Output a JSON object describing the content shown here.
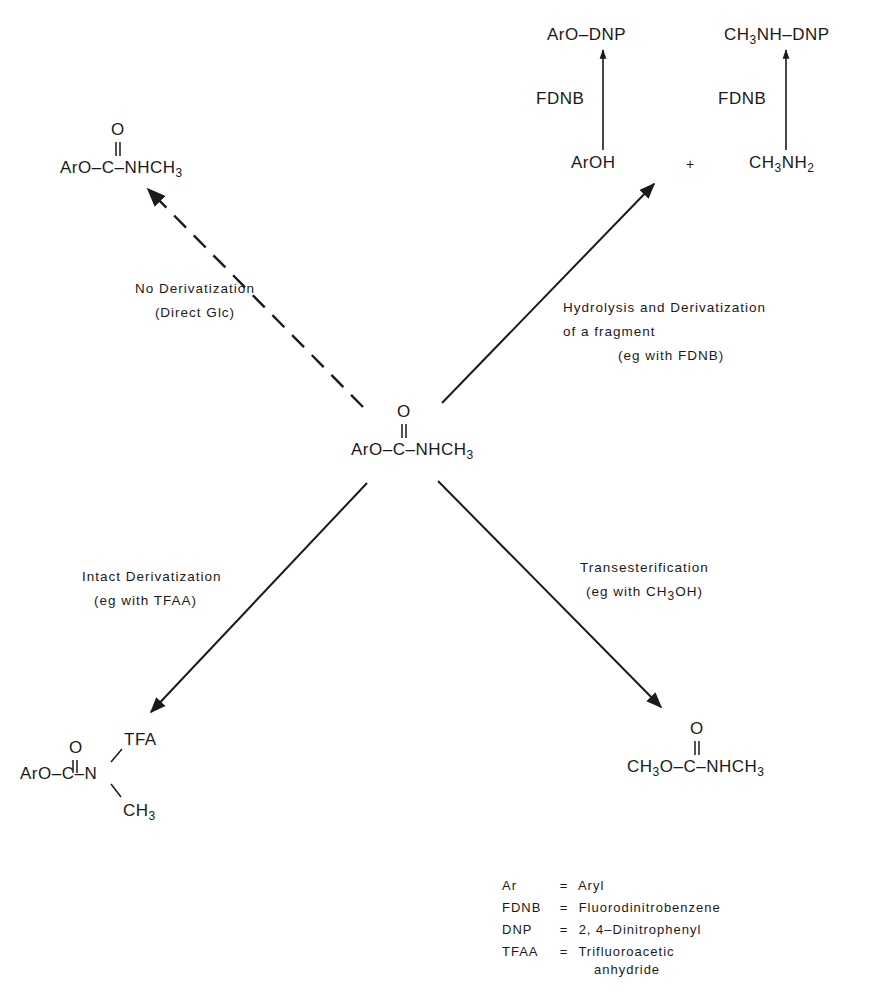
{
  "center": {
    "prefix": "ArO–C–NHCH",
    "sub": "3",
    "carbonyl": "O"
  },
  "products": {
    "no_derivatization": {
      "prefix": "ArO–C–NHCH",
      "sub": "3",
      "carbonyl": "O"
    },
    "hydrolysis": {
      "phenol": "ArOH",
      "plus": "+",
      "amine_pre": "CH",
      "amine_sub1": "3",
      "amine_mid": "NH",
      "amine_sub2": "2",
      "reagent_left": "FDNB",
      "reagent_right": "FDNB",
      "product_left": "ArO–DNP",
      "product_right_pre": "CH",
      "product_right_sub": "3",
      "product_right_post": "NH–DNP"
    },
    "intact": {
      "prefix": "ArO–C–N",
      "carbonyl": "O",
      "top_group": "TFA",
      "bottom_pre": "CH",
      "bottom_sub": "3"
    },
    "transesterification": {
      "pre": "CH",
      "sub1": "3",
      "mid": "O–C–NHCH",
      "sub2": "3",
      "carbonyl": "O"
    }
  },
  "labels": {
    "no_derivatization": {
      "line1": "No Derivatization",
      "line2": "(Direct Glc)"
    },
    "hydrolysis": {
      "line1": "Hydrolysis and Derivatization",
      "line2": "of a fragment",
      "line3": "(eg with FDNB)"
    },
    "intact": {
      "line1": "Intact Derivatization",
      "line2": "(eg with TFAA)"
    },
    "transesterification": {
      "line1": "Transesterification",
      "line2_pre": "(eg with CH",
      "line2_sub": "3",
      "line2_post": "OH)"
    }
  },
  "legend": [
    {
      "abbr": "Ar",
      "eq": "=",
      "meaning": "Aryl"
    },
    {
      "abbr": "FDNB",
      "eq": "=",
      "meaning": "Fluorodinitrobenzene"
    },
    {
      "abbr": "DNP",
      "eq": "=",
      "meaning": "2, 4–Dinitrophenyl"
    },
    {
      "abbr": "TFAA",
      "eq": "=",
      "meaning": "Trifluoroacetic",
      "meaning2": "anhydride"
    }
  ],
  "arrows": [
    {
      "name": "no-derivatization",
      "style": "dashed"
    },
    {
      "name": "hydrolysis",
      "style": "solid"
    },
    {
      "name": "intact-derivatization",
      "style": "solid"
    },
    {
      "name": "transesterification",
      "style": "solid"
    }
  ]
}
